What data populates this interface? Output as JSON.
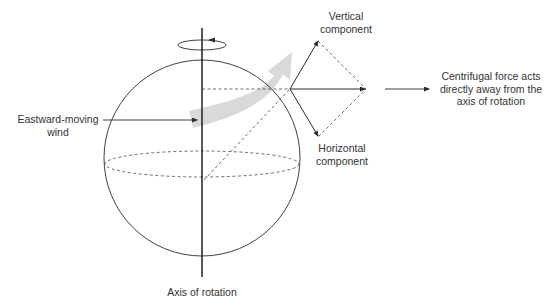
{
  "labels": {
    "vertical_component": [
      "Vertical",
      "component"
    ],
    "horizontal_component": [
      "Horizontal",
      "component"
    ],
    "centrifugal": [
      "Centrifugal force acts",
      "directly away from the",
      "axis of rotation"
    ],
    "eastward_wind": [
      "Eastward-moving",
      "wind"
    ],
    "axis": "Axis of rotation"
  },
  "colors": {
    "line": "#2b2b2b",
    "wind_arrow": "#d9d9d9",
    "dashed": "#4a4a4a",
    "background": "#ffffff"
  }
}
